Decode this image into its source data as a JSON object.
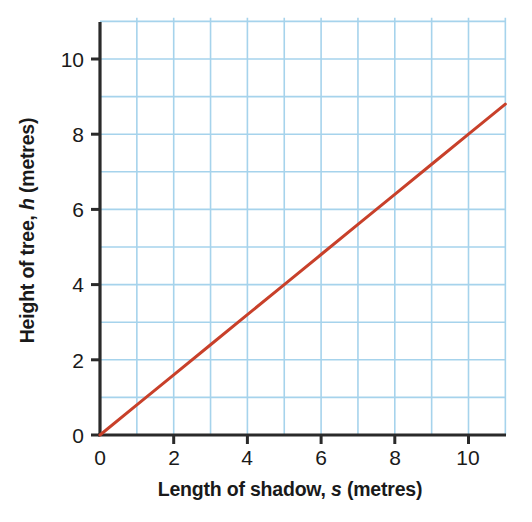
{
  "chart_data": {
    "type": "line",
    "title": "",
    "xlabel_parts": {
      "pre": "Length of shadow, ",
      "sym": "s",
      "post": " (metres)"
    },
    "ylabel_parts": {
      "pre": "Height of tree, ",
      "sym": "h",
      "post": " (metres)"
    },
    "xlabel": "Length of shadow, s (metres)",
    "ylabel": "Height of tree, h (metres)",
    "xlim": [
      0,
      11
    ],
    "ylim": [
      0,
      11.1
    ],
    "xticks": [
      0,
      2,
      4,
      6,
      8,
      10
    ],
    "xtick_labels": [
      "0",
      "2",
      "4",
      "6",
      "8",
      "10"
    ],
    "yticks": [
      0,
      2,
      4,
      6,
      8,
      10
    ],
    "ytick_labels": [
      "0",
      "2",
      "4",
      "6",
      "8",
      "10"
    ],
    "grid": true,
    "grid_step": 1,
    "grid_color": "#a6d3ec",
    "legend": "none",
    "series": [
      {
        "name": "height vs shadow",
        "color": "#c8402a",
        "relation": "h = 0.8 s",
        "slope": 0.8,
        "intercept": 0,
        "x": [
          0,
          1,
          2,
          3,
          4,
          5,
          6,
          7,
          8,
          9,
          10,
          11
        ],
        "values": [
          0,
          0.8,
          1.6,
          2.4,
          3.2,
          4,
          4.8,
          5.6,
          6.4,
          7.2,
          8,
          8.8
        ]
      }
    ],
    "axis_color": "#2a2a2a",
    "background": "#ffffff"
  }
}
